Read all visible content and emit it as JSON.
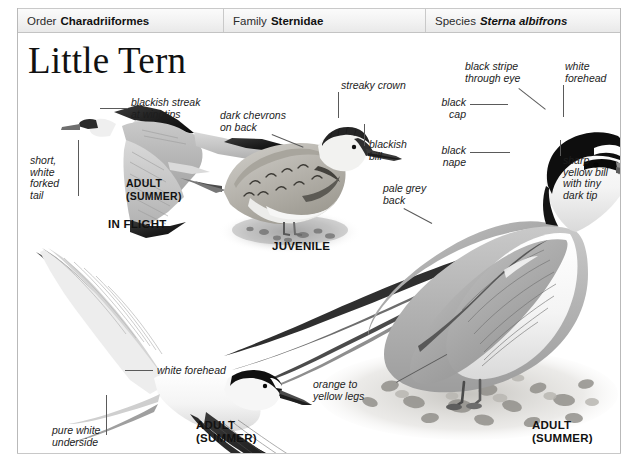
{
  "page": {
    "title": "Little Tern",
    "background_color": "#ffffff",
    "frame_color": "#b9b9b9"
  },
  "taxonomy": {
    "cells": [
      {
        "rank": "Order",
        "name": "Charadriiformes",
        "italic": false
      },
      {
        "rank": "Family",
        "name": "Sternidae",
        "italic": false
      },
      {
        "rank": "Species",
        "name": "Sterna albifrons",
        "italic": true
      }
    ]
  },
  "annotations": [
    {
      "id": "blackish-streak-at-wingtips",
      "text": "blackish streak\nat wingtips"
    },
    {
      "id": "short-white-forked-tail",
      "text": "short,\nwhite\nforked\ntail"
    },
    {
      "id": "dark-chevrons-on-back",
      "text": "dark chevrons\non back"
    },
    {
      "id": "streaky-crown",
      "text": "streaky crown"
    },
    {
      "id": "blackish-bill",
      "text": "blackish\nbill"
    },
    {
      "id": "pale-grey-back",
      "text": "pale grey\nback"
    },
    {
      "id": "black-stripe-through-eye",
      "text": "black stripe\nthrough eye"
    },
    {
      "id": "white-forehead-top",
      "text": "white\nforehead"
    },
    {
      "id": "black-cap",
      "text": "black\ncap"
    },
    {
      "id": "black-nape",
      "text": "black\nnape"
    },
    {
      "id": "sharp-yellow-bill",
      "text": "sharp\nyellow bill\nwith tiny\ndark tip"
    },
    {
      "id": "orange-to-yellow-legs",
      "text": "orange to\nyellow legs"
    },
    {
      "id": "white-forehead-bottom",
      "text": "white forehead"
    },
    {
      "id": "pure-white-underside",
      "text": "pure white\nunderside"
    }
  ],
  "plate_labels": [
    {
      "id": "adult-summer-inflight",
      "text": "ADULT\n(SUMMER)"
    },
    {
      "id": "in-flight",
      "text": "IN FLIGHT"
    },
    {
      "id": "juvenile",
      "text": "JUVENILE"
    },
    {
      "id": "adult-summer-bottom",
      "text": "ADULT\n(SUMMER)"
    },
    {
      "id": "adult-summer-standing",
      "text": "ADULT\n(SUMMER)"
    }
  ],
  "illustrations": [
    {
      "id": "tern-in-flight-upper",
      "subject": "Little Tern, adult summer, in flight seen from above"
    },
    {
      "id": "tern-juvenile-standing",
      "subject": "Little Tern, juvenile, standing on shingle"
    },
    {
      "id": "tern-in-flight-lower",
      "subject": "Little Tern, adult summer, in flight seen from below"
    },
    {
      "id": "tern-adult-standing",
      "subject": "Little Tern, adult summer, standing on shingle beach"
    }
  ]
}
